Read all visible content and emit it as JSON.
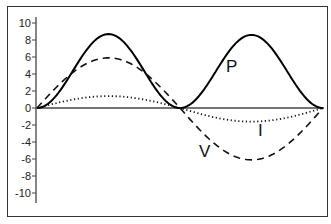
{
  "chart_data": {
    "type": "line",
    "title": "",
    "xlabel": "",
    "ylabel": "",
    "ylim": [
      -11,
      11
    ],
    "yticks": [
      10,
      8,
      6,
      4,
      2,
      0,
      -2,
      -4,
      -6,
      -8,
      -10
    ],
    "ytick_labels": [
      "10",
      "8",
      "6",
      "4",
      "2",
      "0",
      "-2",
      "-4",
      "-6",
      "-8",
      "-10"
    ],
    "x_range": [
      0,
      1
    ],
    "grid": false,
    "legend": "inline labels",
    "series": [
      {
        "name": "P",
        "style": "solid",
        "description": "instantaneous power, sin^2 shape, two positive humps",
        "peaks": [
          8.7,
          8.6
        ],
        "values_at_quarter_points": [
          0,
          8.7,
          0,
          8.6,
          0
        ]
      },
      {
        "name": "V",
        "style": "dashed",
        "description": "voltage, one full sine cycle",
        "amplitude": 6.0,
        "values_at_quarter_points": [
          0,
          5.9,
          0,
          -6.1,
          0
        ]
      },
      {
        "name": "I",
        "style": "dotted",
        "description": "current, one full sine cycle in phase with V",
        "amplitude": 1.5,
        "values_at_quarter_points": [
          0,
          1.4,
          0,
          -1.6,
          0
        ]
      }
    ],
    "annotations": [
      {
        "text": "P",
        "near": "second power hump"
      },
      {
        "text": "I",
        "near": "current trough"
      },
      {
        "text": "V",
        "near": "voltage trough"
      }
    ]
  },
  "labels": {
    "p": "P",
    "i": "I",
    "v": "V"
  }
}
